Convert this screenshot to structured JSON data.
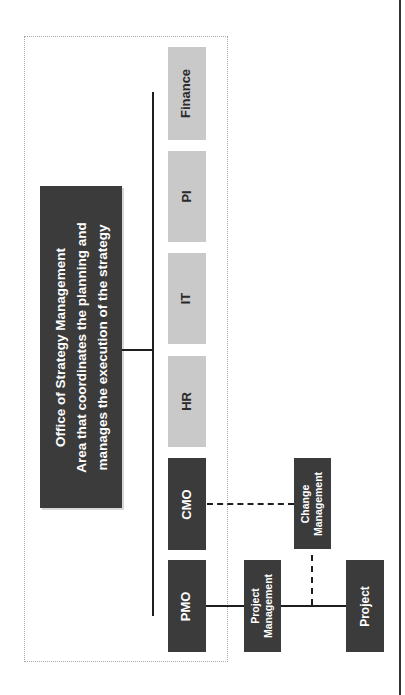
{
  "diagram": {
    "orientation": "rotated-90-ccw",
    "root": {
      "title": "Office of Strategy Management",
      "line2": "Area that coordinates the planning and",
      "line3": "manages the execution of the strategy"
    },
    "departments": [
      {
        "label": "PMO",
        "style": "dark"
      },
      {
        "label": "CMO",
        "style": "dark"
      },
      {
        "label": "HR",
        "style": "light"
      },
      {
        "label": "IT",
        "style": "light"
      },
      {
        "label": "PI",
        "style": "light"
      },
      {
        "label": "Finance",
        "style": "light"
      }
    ],
    "sub_units": {
      "project_management": {
        "line1": "Project",
        "line2": "Management"
      },
      "change_management": {
        "line1": "Change",
        "line2": "Management"
      },
      "project": {
        "label": "Project"
      }
    },
    "connections": [
      {
        "from": "Office of Strategy Management",
        "to": "all departments",
        "style": "solid"
      },
      {
        "from": "PMO",
        "to": "Project Management",
        "style": "solid"
      },
      {
        "from": "Project Management",
        "to": "Project",
        "style": "solid"
      },
      {
        "from": "CMO",
        "to": "Change Management",
        "style": "dashed"
      },
      {
        "from": "Change Management",
        "to": "PMO-Project line",
        "style": "dashed"
      }
    ],
    "colors": {
      "dark_box": "#3b3b3b",
      "light_box": "#c9c9c9",
      "line": "#1e1e1e",
      "frame": "#a8a8a8"
    }
  }
}
